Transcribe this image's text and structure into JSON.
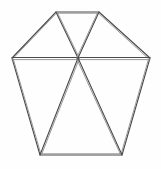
{
  "figure": {
    "type": "line-drawing",
    "background_color": "#fefefe",
    "stroke_color": "#4a4a4a",
    "stroke_color_light": "#8d8d8d",
    "stroke_width": 1.1,
    "canvas": {
      "width": 161,
      "height": 169
    },
    "vertex_count": 5,
    "interior_spoke_count": 5,
    "triangle_count": 5,
    "vertices": [
      {
        "name": "top-left-apex",
        "label": "A",
        "x": 56,
        "y": 12
      },
      {
        "name": "top-right-apex",
        "label": "B",
        "x": 99,
        "y": 12
      },
      {
        "name": "right-middle",
        "label": "C",
        "x": 150,
        "y": 58
      },
      {
        "name": "bottom-right",
        "label": "D",
        "x": 122,
        "y": 155
      },
      {
        "name": "bottom-left",
        "label": "E",
        "x": 40,
        "y": 155
      },
      {
        "name": "left-middle",
        "label": "F",
        "x": 12,
        "y": 58
      }
    ],
    "center": {
      "name": "center-point",
      "label": "O",
      "x": 78,
      "y": 58
    },
    "outline_edges": [
      {
        "name": "edge-top",
        "from": "top-left-apex",
        "to": "top-right-apex"
      },
      {
        "name": "edge-upper-right",
        "from": "top-right-apex",
        "to": "right-middle"
      },
      {
        "name": "edge-lower-right",
        "from": "right-middle",
        "to": "bottom-right"
      },
      {
        "name": "edge-bottom",
        "from": "bottom-right",
        "to": "bottom-left"
      },
      {
        "name": "edge-lower-left",
        "from": "bottom-left",
        "to": "left-middle"
      },
      {
        "name": "edge-upper-left",
        "from": "left-middle",
        "to": "top-left-apex"
      }
    ],
    "spoke_edges": [
      {
        "name": "spoke-to-top-left-apex",
        "from": "center-point",
        "to": "top-left-apex"
      },
      {
        "name": "spoke-to-top-right-apex",
        "from": "center-point",
        "to": "top-right-apex"
      },
      {
        "name": "spoke-to-bottom-right",
        "from": "center-point",
        "to": "bottom-right"
      },
      {
        "name": "spoke-to-bottom-left",
        "from": "center-point",
        "to": "bottom-left"
      },
      {
        "name": "spoke-to-left-middle",
        "from": "center-point",
        "to": "left-middle"
      },
      {
        "name": "spoke-to-right-middle",
        "from": "center-point",
        "to": "right-middle"
      }
    ],
    "paths": {
      "outline": "M 56,12 L 99,12 L 150,58 L 122,155 L 40,155 L 12,58 Z",
      "outline_echo": "M 56.8,13.2 L 98.4,13.2 L 148.6,58.8 L 121.2,153.8 L 40.8,153.8 L 13.2,58.8 Z",
      "horizontal_chord": "M 12,57.5 L 150,57.5",
      "horizontal_chord_echo": "M 12,59.6 L 150,59.6",
      "spoke_top_left": "M 78,58 L 56,12",
      "spoke_top_left_echo": "M 79.3,58 L 57.4,12.6",
      "spoke_top_right": "M 78,58 L 99,12",
      "spoke_top_right_echo": "M 76.8,58 L 97.6,12.6",
      "spoke_bottom_left": "M 78,58 L 40,155",
      "spoke_bottom_left_echo": "M 79.4,58.4 L 41.6,154.4",
      "spoke_bottom_right": "M 78,58 L 122,155",
      "spoke_bottom_right_echo": "M 76.6,58.4 L 120.5,154.4"
    }
  }
}
